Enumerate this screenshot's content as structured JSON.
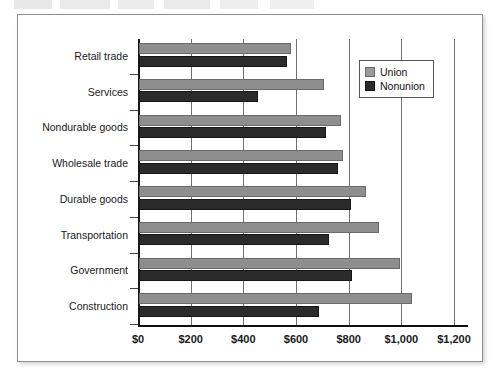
{
  "figure": {
    "top_partial_text": "",
    "frame_visible": true
  },
  "legend": {
    "position": "top-right-inside",
    "items": [
      {
        "label": "Union",
        "swatch": "union-swatch",
        "color": "#8e8e8e"
      },
      {
        "label": "Nonunion",
        "swatch": "nonunion-swatch",
        "color": "#2b2b2b"
      }
    ]
  },
  "chart_data": {
    "type": "bar",
    "orientation": "horizontal",
    "title": "",
    "xlabel": "",
    "ylabel": "",
    "xlim": [
      0,
      1200
    ],
    "grid": true,
    "legend_position": "top-right",
    "tick_labels": [
      "$0",
      "$200",
      "$400",
      "$600",
      "$800",
      "$1,000",
      "$1,200"
    ],
    "ticks": [
      0,
      200,
      400,
      600,
      800,
      1000,
      1200
    ],
    "categories": [
      "Retail trade",
      "Services",
      "Nondurable goods",
      "Wholesale trade",
      "Durable goods",
      "Transportation",
      "Government",
      "Construction"
    ],
    "series": [
      {
        "name": "Union",
        "color": "#8e8e8e",
        "values": [
          577,
          703,
          767,
          775,
          862,
          912,
          992,
          1037
        ]
      },
      {
        "name": "Nonunion",
        "color": "#2b2b2b",
        "values": [
          562,
          452,
          710,
          756,
          805,
          722,
          809,
          684
        ]
      }
    ]
  }
}
